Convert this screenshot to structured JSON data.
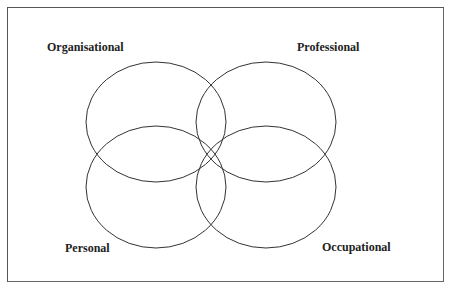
{
  "diagram": {
    "type": "venn",
    "sets": [
      {
        "id": "organisational",
        "label": "Organisational",
        "cx": 156,
        "cy": 122,
        "rx": 70,
        "ry": 60,
        "label_x": 47,
        "label_y": 40
      },
      {
        "id": "professional",
        "label": "Professional",
        "cx": 266,
        "cy": 122,
        "rx": 70,
        "ry": 60,
        "label_x": 297,
        "label_y": 40
      },
      {
        "id": "personal",
        "label": "Personal",
        "cx": 156,
        "cy": 187,
        "rx": 70,
        "ry": 61,
        "label_x": 65,
        "label_y": 241
      },
      {
        "id": "occupational",
        "label": "Occupational",
        "cx": 266,
        "cy": 187,
        "rx": 70,
        "ry": 61,
        "label_x": 322,
        "label_y": 240
      }
    ],
    "stroke_color": "#333333",
    "border_color": "#555555"
  }
}
